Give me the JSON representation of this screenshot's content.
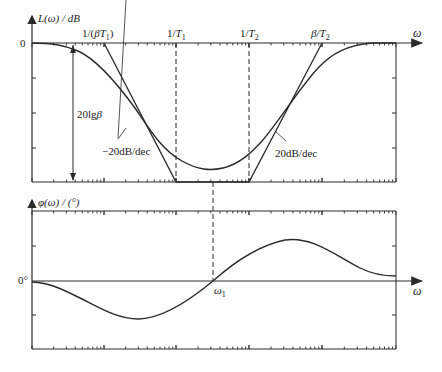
{
  "figure": {
    "type": "bode_plot"
  },
  "magnitude_plot": {
    "y_axis_label": "L(ω) / dB",
    "x_axis_label": "ω",
    "zero_label": "0",
    "corner_labels": [
      "1/(βT1)",
      "1/T1",
      "1/T2",
      "β/T2"
    ],
    "corner_label_parts": [
      {
        "pre": "1/(",
        "var": "βT",
        "sub": "1",
        "post": ")"
      },
      {
        "pre": "1/",
        "var": "T",
        "sub": "1",
        "post": ""
      },
      {
        "pre": "1/",
        "var": "T",
        "sub": "2",
        "post": ""
      },
      {
        "pre": "",
        "var": "β/T",
        "sub": "2",
        "post": ""
      }
    ],
    "depth_annotation": "20lgβ",
    "depth_annotation_parts": {
      "pre": "20lg",
      "var": "β"
    },
    "slope_left": "−20dB/dec",
    "slope_right": "20dB/dec"
  },
  "phase_plot": {
    "y_axis_label": "φ(ω) / (°)",
    "x_axis_label": "ω",
    "zero_label": "0°",
    "crossover_label": "ω1",
    "crossover_parts": {
      "var": "ω",
      "sub": "1"
    }
  },
  "colors": {
    "line": "#2a2a2a",
    "background": "#ffffff"
  }
}
